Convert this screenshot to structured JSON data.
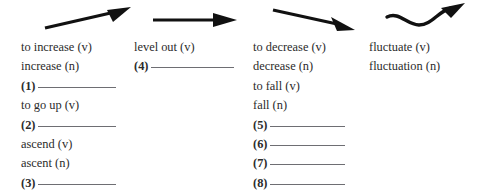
{
  "worksheet": {
    "background_color": "#ffffff",
    "text_color": "#2b2b2b",
    "rule_color": "#6e6e73",
    "arrow_color": "#111111",
    "columns": [
      {
        "arrow_icon": "arrow-up-right-icon",
        "arrow_meaning": "rising trend",
        "entries": [
          {
            "type": "word",
            "text": "to increase (v)"
          },
          {
            "type": "word",
            "text": "increase (n)"
          },
          {
            "type": "blank",
            "number": "(1)",
            "text": ""
          },
          {
            "type": "word",
            "text": "to go up (v)"
          },
          {
            "type": "blank",
            "number": "(2)",
            "text": ""
          },
          {
            "type": "word",
            "text": "ascend (v)"
          },
          {
            "type": "word",
            "text": "ascent (n)"
          },
          {
            "type": "blank",
            "number": "(3)",
            "text": ""
          }
        ]
      },
      {
        "arrow_icon": "arrow-right-icon",
        "arrow_meaning": "flat trend",
        "entries": [
          {
            "type": "word",
            "text": "level out (v)"
          },
          {
            "type": "blank",
            "number": "(4)",
            "text": ""
          }
        ]
      },
      {
        "arrow_icon": "arrow-down-right-icon",
        "arrow_meaning": "falling trend",
        "entries": [
          {
            "type": "word",
            "text": "to decrease (v)"
          },
          {
            "type": "word",
            "text": "decrease (n)"
          },
          {
            "type": "word",
            "text": "to fall (v)"
          },
          {
            "type": "word",
            "text": "fall (n)"
          },
          {
            "type": "blank",
            "number": "(5)",
            "text": ""
          },
          {
            "type": "blank",
            "number": "(6)",
            "text": ""
          },
          {
            "type": "blank",
            "number": "(7)",
            "text": ""
          },
          {
            "type": "blank",
            "number": "(8)",
            "text": ""
          }
        ]
      },
      {
        "arrow_icon": "arrow-wavy-up-right-icon",
        "arrow_meaning": "fluctuating trend",
        "entries": [
          {
            "type": "word",
            "text": "fluctuate (v)"
          },
          {
            "type": "word",
            "text": "fluctuation (n)"
          }
        ]
      }
    ]
  }
}
